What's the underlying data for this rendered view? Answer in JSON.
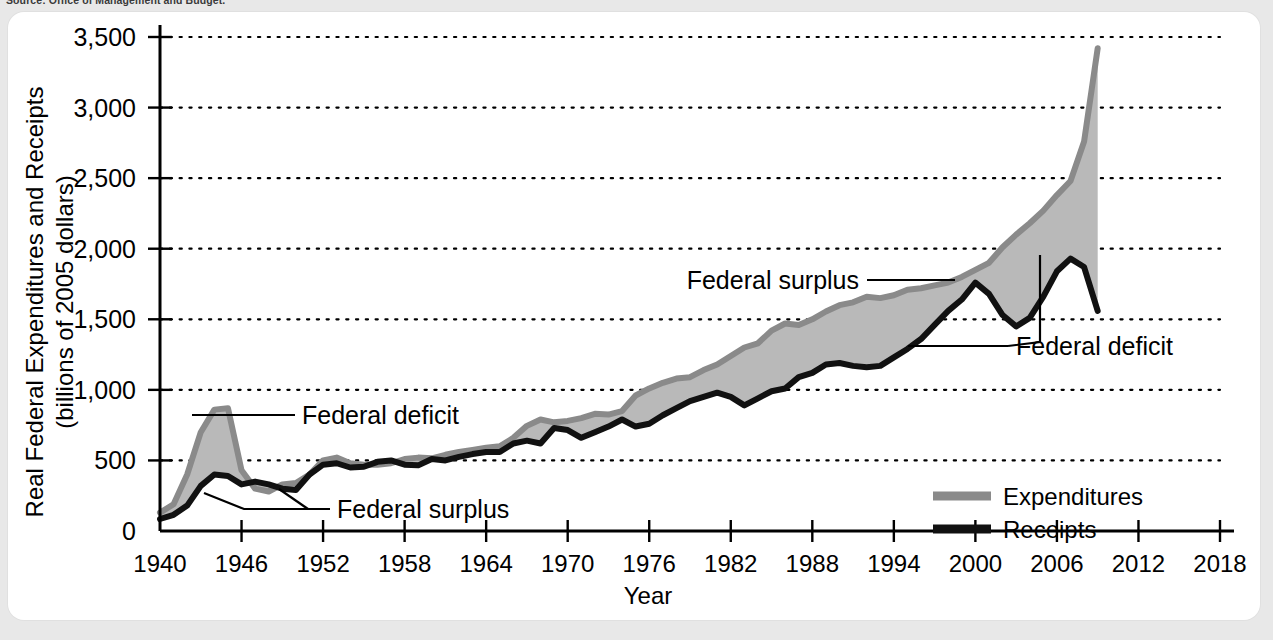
{
  "source_note": "Source: Office of Management and Budget.",
  "chart_data": {
    "type": "area",
    "title": "",
    "xlabel": "Year",
    "ylabel": "Real Federal Expenditures and Receipts",
    "ylabel_line2": "(billions of 2005 dollars)",
    "xlim": [
      1940,
      2018
    ],
    "ylim": [
      0,
      3500
    ],
    "grid": true,
    "grid_axis": "y",
    "legend_position": "bottom-right",
    "ytick_labels": [
      "0",
      "500",
      "1,000",
      "1,500",
      "2,000",
      "2,500",
      "3,000",
      "3,500"
    ],
    "yticks": [
      0,
      500,
      1000,
      1500,
      2000,
      2500,
      3000,
      3500
    ],
    "xtick_labels": [
      "1940",
      "1946",
      "1952",
      "1958",
      "1964",
      "1970",
      "1976",
      "1982",
      "1988",
      "1994",
      "2000",
      "2006",
      "2012",
      "2018"
    ],
    "xticks": [
      1940,
      1946,
      1952,
      1958,
      1964,
      1970,
      1976,
      1982,
      1988,
      1994,
      2000,
      2006,
      2012,
      2018
    ],
    "colors": {
      "expenditures_line": "#8a8a8a",
      "receipts_line": "#111111",
      "gap_fill": "#b9b9b9",
      "axis": "#000000",
      "panel_background": "#ffffff",
      "page_background": "#e8e8e8"
    },
    "x": [
      1940,
      1941,
      1942,
      1943,
      1944,
      1945,
      1946,
      1947,
      1948,
      1949,
      1950,
      1951,
      1952,
      1953,
      1954,
      1955,
      1956,
      1957,
      1958,
      1959,
      1960,
      1961,
      1962,
      1963,
      1964,
      1965,
      1966,
      1967,
      1968,
      1969,
      1970,
      1971,
      1972,
      1973,
      1974,
      1975,
      1976,
      1977,
      1978,
      1979,
      1980,
      1981,
      1982,
      1983,
      1984,
      1985,
      1986,
      1987,
      1988,
      1989,
      1990,
      1991,
      1992,
      1993,
      1994,
      1995,
      1996,
      1997,
      1998,
      1999,
      2000,
      2001,
      2002,
      2003,
      2004,
      2005,
      2006,
      2007,
      2008,
      2009
    ],
    "series": [
      {
        "name": "Expenditures",
        "color": "#8a8a8a",
        "values": [
          130,
          190,
          400,
          700,
          860,
          870,
          430,
          300,
          280,
          330,
          340,
          400,
          500,
          520,
          480,
          470,
          470,
          480,
          510,
          520,
          515,
          540,
          560,
          575,
          590,
          600,
          660,
          745,
          790,
          770,
          780,
          800,
          830,
          825,
          850,
          960,
          1010,
          1050,
          1080,
          1090,
          1140,
          1180,
          1240,
          1300,
          1330,
          1420,
          1470,
          1460,
          1500,
          1555,
          1600,
          1620,
          1660,
          1650,
          1670,
          1710,
          1720,
          1740,
          1760,
          1800,
          1850,
          1900,
          2010,
          2100,
          2180,
          2270,
          2380,
          2480,
          2760,
          3420
        ]
      },
      {
        "name": "Receipts",
        "color": "#111111",
        "values": [
          85,
          115,
          180,
          320,
          400,
          390,
          330,
          350,
          330,
          300,
          290,
          400,
          470,
          480,
          450,
          455,
          490,
          500,
          470,
          465,
          510,
          500,
          525,
          545,
          560,
          560,
          620,
          640,
          620,
          730,
          715,
          660,
          700,
          740,
          790,
          740,
          760,
          820,
          870,
          920,
          950,
          980,
          950,
          890,
          940,
          990,
          1010,
          1090,
          1120,
          1180,
          1190,
          1170,
          1160,
          1170,
          1230,
          1290,
          1360,
          1460,
          1560,
          1640,
          1760,
          1680,
          1530,
          1450,
          1510,
          1660,
          1840,
          1930,
          1870,
          1560
        ]
      }
    ],
    "annotations": [
      {
        "label": "Federal deficit",
        "x": 1944,
        "y": 620,
        "side": "left"
      },
      {
        "label": "Federal surplus",
        "x": 1953,
        "y": 330,
        "side": "left"
      },
      {
        "label": "Federal surplus",
        "x": 1999,
        "y": 1870,
        "side": "right"
      },
      {
        "label": "Federal deficit",
        "x": 2003,
        "y": 1540,
        "side": "right"
      }
    ],
    "legend": [
      {
        "label": "Expenditures",
        "color": "#8a8a8a"
      },
      {
        "label": "Receipts",
        "color": "#111111"
      }
    ]
  }
}
